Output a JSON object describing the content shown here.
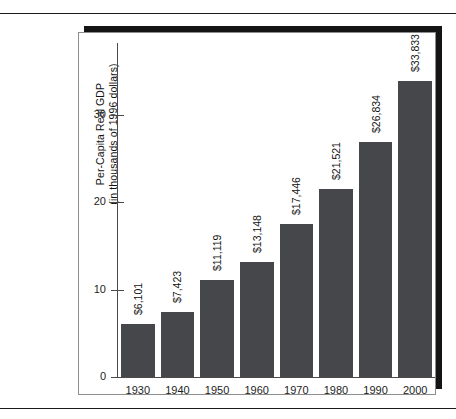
{
  "chart_data": {
    "type": "bar",
    "title": "",
    "xlabel": "",
    "ylabel": "Per-Capita Real GDP (in thousands of 1996 dollars)",
    "ylabel_line1": "Per-Capita Real GDP",
    "ylabel_line2": "(in thousands of 1996 dollars)",
    "ylim": [
      0,
      38.2
    ],
    "yticks": [
      0,
      10,
      20,
      30
    ],
    "ytick_labels": [
      "0",
      "10",
      "20",
      "30"
    ],
    "grid": false,
    "legend": "none",
    "categories": [
      "1930",
      "1940",
      "1950",
      "1960",
      "1970",
      "1980",
      "1990",
      "2000"
    ],
    "values": [
      6.101,
      7.423,
      11.119,
      13.148,
      17.446,
      21.521,
      26.834,
      33.833
    ],
    "data_labels": [
      "$6,101",
      "$7,423",
      "$11,119",
      "$13,148",
      "$17,446",
      "$21,521",
      "$26,834",
      "$33,833"
    ],
    "bar_color": "#45474a",
    "axis_color": "#4a4a4a",
    "background": "#ffffff"
  },
  "figure": {
    "frame_border_color": "#8d8d8d",
    "shadow_color": "#141414",
    "rule_color": "#1b1b1b"
  }
}
